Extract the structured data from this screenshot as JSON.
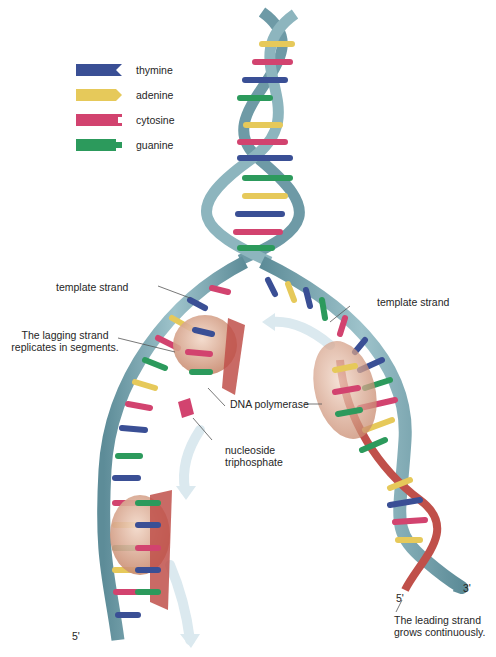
{
  "legend": {
    "items": [
      {
        "name": "thymine",
        "color": "#3a4f95"
      },
      {
        "name": "adenine",
        "color": "#e6c95a"
      },
      {
        "name": "cytosine",
        "color": "#d2436f"
      },
      {
        "name": "guanine",
        "color": "#2c9a5c"
      }
    ]
  },
  "labels": {
    "template_strand_left": "template strand",
    "template_strand_right": "template strand",
    "lagging_strand_line1": "The lagging strand",
    "lagging_strand_line2": "replicates in segments.",
    "dna_polymerase": "DNA polymerase",
    "nucleoside_line1": "nucleoside",
    "nucleoside_line2": "triphosphate",
    "leading_strand_line1": "The leading strand",
    "leading_strand_line2": "grows continuously.",
    "five_prime_left": "5'",
    "five_prime_right": "5'",
    "three_prime_right": "3'"
  },
  "colors": {
    "backbone": "#7aa6b0",
    "backbone_dark": "#4f7f8c",
    "new_strand": "#c0504a",
    "enzyme": "#d9a78c",
    "arrow": "#d6e6ee"
  }
}
